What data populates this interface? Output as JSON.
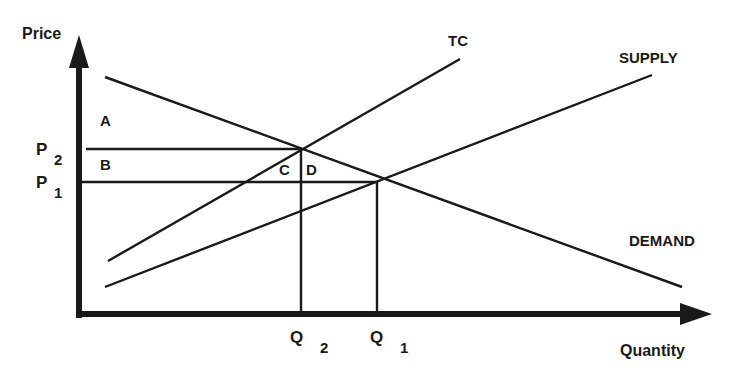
{
  "diagram": {
    "type": "economics supply-demand diagram with tax cost",
    "axes": {
      "y_label": "Price",
      "x_label": "Quantity"
    },
    "curves": [
      {
        "name": "TC",
        "label": "TC",
        "from": [
          108,
          261
        ],
        "to": [
          460,
          59
        ]
      },
      {
        "name": "SUPPLY",
        "label": "SUPPLY",
        "from": [
          105,
          287
        ],
        "to": [
          652,
          75
        ]
      },
      {
        "name": "DEMAND",
        "label": "DEMAND",
        "from": [
          105,
          77
        ],
        "to": [
          682,
          287
        ]
      }
    ],
    "price_levels": [
      {
        "label": "P",
        "sub": "2",
        "y": 149
      },
      {
        "label": "P",
        "sub": "1",
        "y": 182
      }
    ],
    "quantity_levels": [
      {
        "label": "Q",
        "sub": "2",
        "x": 301
      },
      {
        "label": "Q",
        "sub": "1",
        "x": 377
      }
    ],
    "areas": [
      {
        "label": "A"
      },
      {
        "label": "B"
      },
      {
        "label": "C"
      },
      {
        "label": "D"
      }
    ],
    "colors": {
      "ink": "#1a1a1a",
      "background": "#ffffff"
    }
  }
}
